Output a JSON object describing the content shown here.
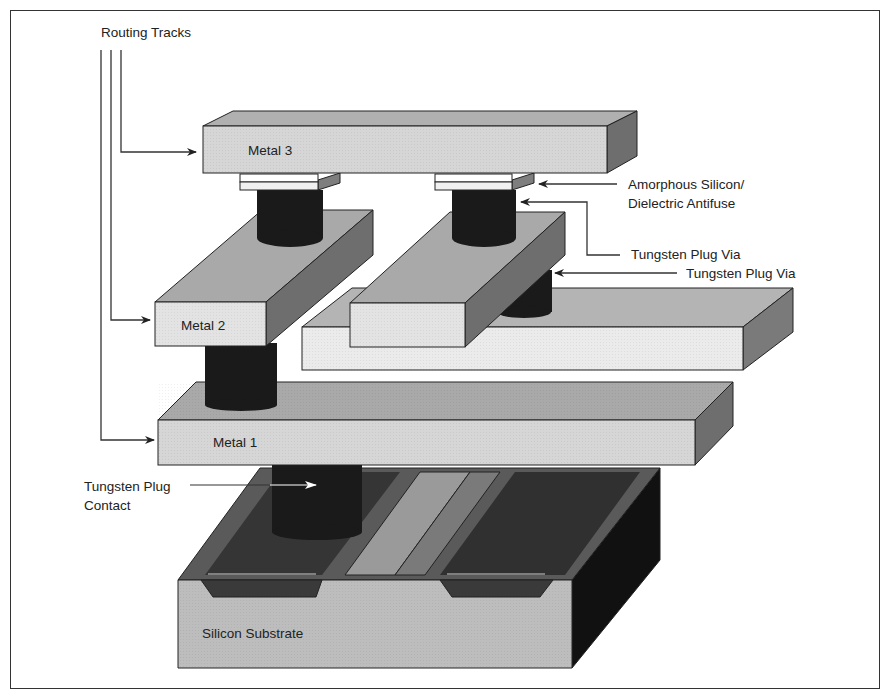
{
  "diagram": {
    "labels": {
      "routing_tracks": "Routing Tracks",
      "metal3": "Metal 3",
      "metal2": "Metal 2",
      "metal1": "Metal 1",
      "antifuse_line1": "Amorphous Silicon/",
      "antifuse_line2": "Dielectric Antifuse",
      "via_upper": "Tungsten Plug Via",
      "via_lower": "Tungsten Plug Via",
      "contact_line1": "Tungsten Plug",
      "contact_line2": "Contact",
      "substrate": "Silicon Substrate"
    },
    "colors": {
      "metal_front": "#d6d6d6",
      "metal_light_front": "#ebebeb",
      "metal_top": "#a9a9a9",
      "metal_side": "#6e6e6e",
      "plug": "#1a1a1a",
      "antifuse": "#f4f4f4",
      "substrate_front": "#bdbdbd",
      "substrate_well": "#3c3c3c",
      "substrate_side": "#111111",
      "lines": "#222222"
    }
  }
}
